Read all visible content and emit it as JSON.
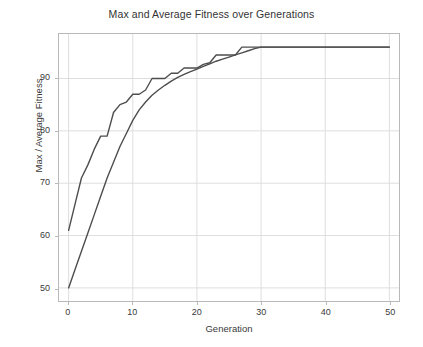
{
  "chart_data": {
    "type": "line",
    "title": "Max and Average Fitness over Generations",
    "xlabel": "Generation",
    "ylabel": "Max / Average Fitness",
    "xlim": [
      -1.5,
      51.5
    ],
    "ylim": [
      47.5,
      98.5
    ],
    "xticks": [
      0,
      10,
      20,
      30,
      40,
      50
    ],
    "yticks": [
      50,
      60,
      70,
      80,
      90
    ],
    "grid": true,
    "legend": "none",
    "line_color": "#4d4d4d",
    "x": [
      0,
      1,
      2,
      3,
      4,
      5,
      6,
      7,
      8,
      9,
      10,
      11,
      12,
      13,
      14,
      15,
      16,
      17,
      18,
      19,
      20,
      21,
      22,
      23,
      24,
      25,
      26,
      27,
      28,
      29,
      30,
      31,
      32,
      33,
      34,
      35,
      36,
      37,
      38,
      39,
      40,
      41,
      42,
      43,
      44,
      45,
      46,
      47,
      48,
      49,
      50
    ],
    "series": [
      {
        "name": "Max Fitness",
        "values": [
          61,
          66,
          71,
          73.5,
          76.5,
          79,
          79,
          83.5,
          85,
          85.5,
          87,
          87,
          87.8,
          90,
          90,
          90,
          91,
          91,
          92,
          92,
          92,
          92.7,
          93,
          94.5,
          94.5,
          94.5,
          94.5,
          96,
          96,
          96,
          96,
          96,
          96,
          96,
          96,
          96,
          96,
          96,
          96,
          96,
          96,
          96,
          96,
          96,
          96,
          96,
          96,
          96,
          96,
          96,
          96
        ]
      },
      {
        "name": "Average Fitness",
        "values": [
          50,
          53.5,
          57,
          60.5,
          64,
          67.5,
          71,
          74,
          77,
          79.5,
          82,
          84,
          85.5,
          86.8,
          87.8,
          88.7,
          89.5,
          90.2,
          90.8,
          91.3,
          91.8,
          92.3,
          92.8,
          93.3,
          93.7,
          94.1,
          94.5,
          94.9,
          95.3,
          95.7,
          96,
          96,
          96,
          96,
          96,
          96,
          96,
          96,
          96,
          96,
          96,
          96,
          96,
          96,
          96,
          96,
          96,
          96,
          96,
          96,
          96
        ]
      }
    ]
  },
  "axis": {
    "ytick_labels": [
      "50",
      "60",
      "70",
      "80",
      "90"
    ],
    "xtick_labels": [
      "0",
      "10",
      "20",
      "30",
      "40",
      "50"
    ]
  }
}
